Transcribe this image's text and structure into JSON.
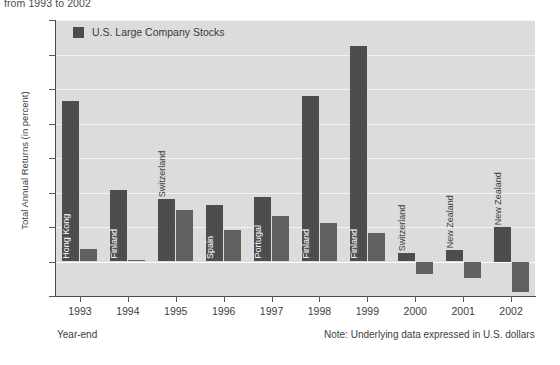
{
  "top_title": "from 1993 to 2002",
  "legend": {
    "label": "U.S. Large Company Stocks",
    "swatch_color": "#4d4d4d"
  },
  "axis": {
    "ylabel": "Total Annual Returns (in percent)",
    "yticks": [
      "175",
      "150",
      "125",
      "100",
      "75",
      "50",
      "25",
      "0",
      "-25"
    ],
    "xticks": [
      "1993",
      "1994",
      "1995",
      "1996",
      "1997",
      "1998",
      "1999",
      "2000",
      "2001",
      "2002"
    ]
  },
  "footnotes": {
    "left": "Year-end",
    "right": "Note: Underlying data expressed in U.S. dollars"
  },
  "colors": {
    "plot_background": "#dcdcdc",
    "country_bar": "#4d4d4d",
    "us_bar": "#606060",
    "gridline": "#f3f3f3",
    "axis": "#4a4a4a"
  },
  "chart_data": {
    "type": "bar",
    "title": "from 1993 to 2002",
    "xlabel": "Year-end",
    "ylabel": "Total Annual Returns (in percent)",
    "ylim": [
      -25,
      175
    ],
    "ytick_step": 25,
    "grid": true,
    "legend_position": "top-left",
    "categories": [
      "1993",
      "1994",
      "1995",
      "1996",
      "1997",
      "1998",
      "1999",
      "2000",
      "2001",
      "2002"
    ],
    "series": [
      {
        "name": "Best Performing Country",
        "color": "#4d4d4d",
        "country_labels": [
          "Hong Kong",
          "Finland",
          "Switzerland",
          "Spain",
          "Portugal",
          "Finland",
          "Finland",
          "Switzerland",
          "New Zealand",
          "New Zealand"
        ],
        "values": [
          116,
          52,
          45,
          41,
          47,
          120,
          156,
          6,
          8,
          25
        ]
      },
      {
        "name": "U.S. Large Company Stocks",
        "color": "#606060",
        "values": [
          9,
          1.3,
          37,
          23,
          33,
          28,
          21,
          -9,
          -12,
          -22
        ]
      }
    ]
  }
}
